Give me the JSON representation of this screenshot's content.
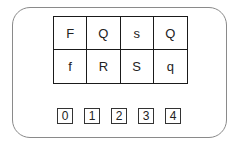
{
  "grid": {
    "rows": [
      [
        "F",
        "Q",
        "s",
        "Q"
      ],
      [
        "f",
        "R",
        "S",
        "q"
      ]
    ]
  },
  "number_boxes": [
    "0",
    "1",
    "2",
    "3",
    "4"
  ]
}
